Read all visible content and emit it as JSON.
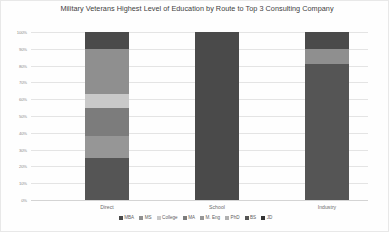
{
  "chart_data": {
    "type": "bar",
    "subtype": "stacked-100-percent",
    "title": "Military Veterans Highest Level of Education by Route to Top 3 Consulting Company",
    "xlabel": "",
    "ylabel": "",
    "ylim": [
      0,
      100
    ],
    "ytick_labels": [
      "100%",
      "90%",
      "80%",
      "70%",
      "60%",
      "50%",
      "40%",
      "30%",
      "20%",
      "10%",
      "0%"
    ],
    "ytick_values": [
      100,
      90,
      80,
      70,
      60,
      50,
      40,
      30,
      20,
      10,
      0
    ],
    "grid": true,
    "legend_position": "bottom",
    "categories": [
      "Direct",
      "School",
      "Industry"
    ],
    "series": [
      {
        "name": "MBA",
        "color": "#4a4a4a",
        "values": [
          10,
          100,
          10
        ]
      },
      {
        "name": "MS",
        "color": "#8f8f8f",
        "values": [
          27,
          0,
          9
        ]
      },
      {
        "name": "College",
        "color": "#c9c9c9",
        "values": [
          8,
          0,
          0
        ]
      },
      {
        "name": "MA",
        "color": "#7c7c7c",
        "values": [
          17,
          0,
          0
        ]
      },
      {
        "name": "M. Eng",
        "color": "#969696",
        "values": [
          13,
          0,
          0
        ]
      },
      {
        "name": "PhD",
        "color": "#b0b0b0",
        "values": [
          0,
          0,
          0
        ]
      },
      {
        "name": "BS",
        "color": "#555555",
        "values": [
          25,
          0,
          81
        ]
      },
      {
        "name": "JD",
        "color": "#333333",
        "values": [
          0,
          0,
          0
        ]
      }
    ]
  }
}
